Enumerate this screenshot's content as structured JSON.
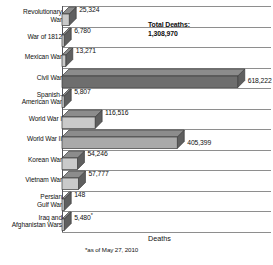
{
  "chart_data": {
    "type": "bar",
    "orientation": "horizontal",
    "title": "",
    "xlabel": "Deaths",
    "ylabel": "",
    "xlim": [
      0,
      700000
    ],
    "grid": true,
    "legend": false,
    "categories": [
      "Revolutionary\nWar",
      "War of 1812",
      "Mexican War",
      "Civil War",
      "Spanish-\nAmerican War",
      "World War I",
      "World War II",
      "Korean War",
      "Vietnam War",
      "Persian\nGulf War",
      "Iraq and\nAfghanistan Wars"
    ],
    "values": [
      25324,
      6780,
      13271,
      618222,
      5807,
      116516,
      405399,
      54246,
      57777,
      148,
      5480
    ],
    "value_labels": [
      "25,324",
      "6,780",
      "13,271",
      "618,222",
      "5,807",
      "116,516",
      "405,399",
      "54,246",
      "57,777",
      "148",
      "5,480"
    ],
    "value_label_suffix": [
      "",
      "",
      "",
      "",
      "",
      "",
      "",
      "",
      "",
      "",
      "*"
    ],
    "annotations": [
      {
        "text": "Total Deaths:\n1,308,970"
      }
    ],
    "footnote": "*as of May 27, 2010",
    "colors": {
      "bar_front_light": "#cacaca",
      "bar_front_mid": "#a9a9a9",
      "bar_front_dark": "#6e6e6e",
      "bar_top": "#8c8c8c",
      "bar_side": "#5f5f5f",
      "outline": "#3b3b3b",
      "gridline": "#8e8e8e",
      "axis": "#55555a",
      "text": "#111111",
      "background": "#ffffff"
    }
  },
  "axis": {
    "x_title": "Deaths"
  },
  "notes": {
    "footnote": "*as of May 27, 2010"
  },
  "annotation": {
    "total_deaths": "Total Deaths:\n1,308,970"
  }
}
